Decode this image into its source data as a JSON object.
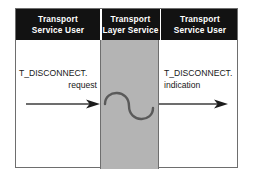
{
  "diagram": {
    "columns": [
      {
        "id": "left",
        "line1": "Transport",
        "line2": "Service User"
      },
      {
        "id": "mid",
        "line1": "Transport",
        "line2": "Layer Service"
      },
      {
        "id": "right",
        "line1": "Transport",
        "line2": "Service User"
      }
    ],
    "messages": [
      {
        "id": "request",
        "primitive": "T_DISCONNECT.",
        "parameter": "request",
        "direction": "right",
        "align": "right"
      },
      {
        "id": "indication",
        "primitive": "T_DISCONNECT.",
        "parameter": "indication",
        "direction": "right",
        "align": "left"
      }
    ],
    "squiggle": {
      "name": "service-provider-squiggle",
      "shape": "s-curve"
    },
    "colors": {
      "header_background": "#121212",
      "header_text": "#ffffff",
      "service_column": "#b4b4b4",
      "frame_border": "#6e6e6e",
      "arrow": "#3c3c3c",
      "squiggle": "#5a5a5a",
      "page_background": "#ffffff",
      "label_text": "#181818"
    }
  }
}
